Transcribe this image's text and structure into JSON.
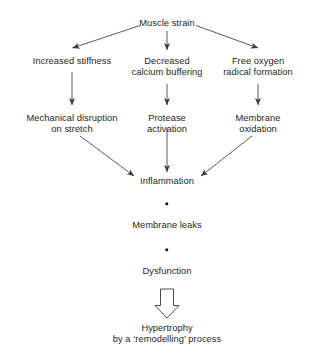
{
  "diagram": {
    "background_color": "#ffffff",
    "text_color": "#231f20",
    "line_color": "#3a3a3a",
    "nodes": {
      "muscle_strain": "Muscle strain",
      "increased_stiffness": "Increased stiffness",
      "decreased_calcium_buffering": "Decreased\ncalcium buffering",
      "free_oxygen_radical_formation": "Free oxygen\nradical formation",
      "mechanical_disruption_on_stretch": "Mechanical disruption\non stretch",
      "protease_activation": "Protease\nactivation",
      "membrane_oxidation": "Membrane\noxidation",
      "inflammation": "Inflammation",
      "membrane_leaks": "Membrane leaks",
      "dysfunction": "Dysfunction",
      "hypertrophy": "Hypertrophy\nby a ‘remodelling’ process"
    },
    "connector_labels": {
      "strain_to_stiffness": "arrow from Muscle strain to Increased stiffness",
      "strain_to_calcium": "arrow from Muscle strain to Decreased calcium buffering",
      "strain_to_radical": "arrow from Muscle strain to Free oxygen radical formation",
      "stiffness_to_mechanical": "arrow from Increased stiffness to Mechanical disruption on stretch",
      "calcium_to_protease": "arrow from Decreased calcium buffering to Protease activation",
      "radical_to_membrane_oxidation": "arrow from Free oxygen radical formation to Membrane oxidation",
      "mechanical_to_inflammation": "arrow from Mechanical disruption on stretch to Inflammation",
      "protease_to_inflammation": "arrow from Protease activation to Inflammation",
      "oxidation_to_inflammation": "arrow from Membrane oxidation to Inflammation",
      "inflammation_to_leaks": "dot connector from Inflammation to Membrane leaks",
      "leaks_to_dysfunction": "dot connector from Membrane leaks to Dysfunction",
      "dysfunction_to_hypertrophy": "hollow block arrow from Dysfunction to Hypertrophy"
    }
  }
}
